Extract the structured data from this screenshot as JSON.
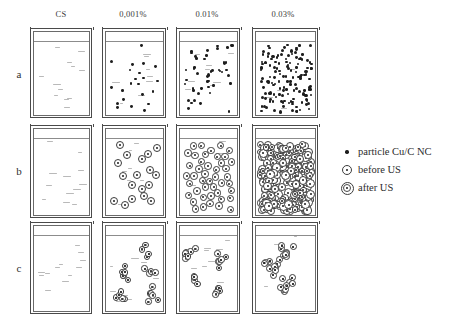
{
  "figure": {
    "columns": [
      {
        "key": "cs",
        "label": "CS"
      },
      {
        "key": "c0001",
        "label": "0,001%"
      },
      {
        "key": "c001",
        "label": "0.01%"
      },
      {
        "key": "c003",
        "label": "0.03%"
      }
    ],
    "rows": [
      {
        "key": "a",
        "label": "a"
      },
      {
        "key": "b",
        "label": "b"
      },
      {
        "key": "c",
        "label": "c"
      }
    ],
    "legend": {
      "items": [
        {
          "symbol": "filled-dot",
          "label": "particle Cu/C NC"
        },
        {
          "symbol": "dot-single-ring",
          "label": "before US"
        },
        {
          "symbol": "dot-double-ring",
          "label": "after US"
        }
      ]
    }
  },
  "chart_data": {
    "type": "diagram",
    "title": "",
    "xlabel": "",
    "ylabel": "",
    "grid": false,
    "legend_position": "right",
    "categories": [
      "CS",
      "0,001%",
      "0.01%",
      "0.03%"
    ],
    "row_categories": [
      "a",
      "b",
      "c"
    ],
    "series": [
      {
        "name": "a",
        "particle_style": "filled-dot",
        "values": [
          0,
          22,
          46,
          140
        ]
      },
      {
        "name": "b",
        "particle_style": "dot-single-ring",
        "values": [
          0,
          18,
          44,
          300
        ]
      },
      {
        "name": "c",
        "particle_style": "dot-double-ring",
        "values": [
          0,
          24,
          58,
          72
        ]
      }
    ]
  }
}
